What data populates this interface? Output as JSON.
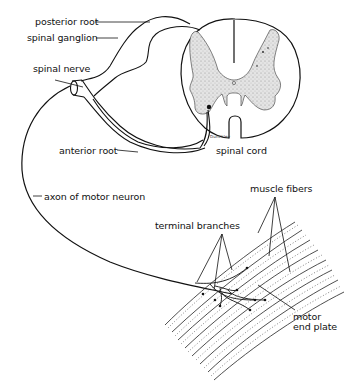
{
  "diagram": {
    "type": "anatomical-illustration",
    "labels": {
      "posterior_root": "posterior root",
      "spinal_ganglion": "spinal ganglion",
      "spinal_nerve": "spinal nerve",
      "anterior_root": "anterior root",
      "spinal_cord": "spinal cord",
      "axon": "axon of motor neuron",
      "terminal_branches": "terminal branches",
      "muscle_fibers": "muscle fibers",
      "motor_end_plate_line1": "motor",
      "motor_end_plate_line2": "end plate"
    },
    "signature": "Dunckley",
    "colors": {
      "ink": "#111111",
      "gray_matter": "#d9d9d9",
      "background": "#ffffff"
    }
  }
}
